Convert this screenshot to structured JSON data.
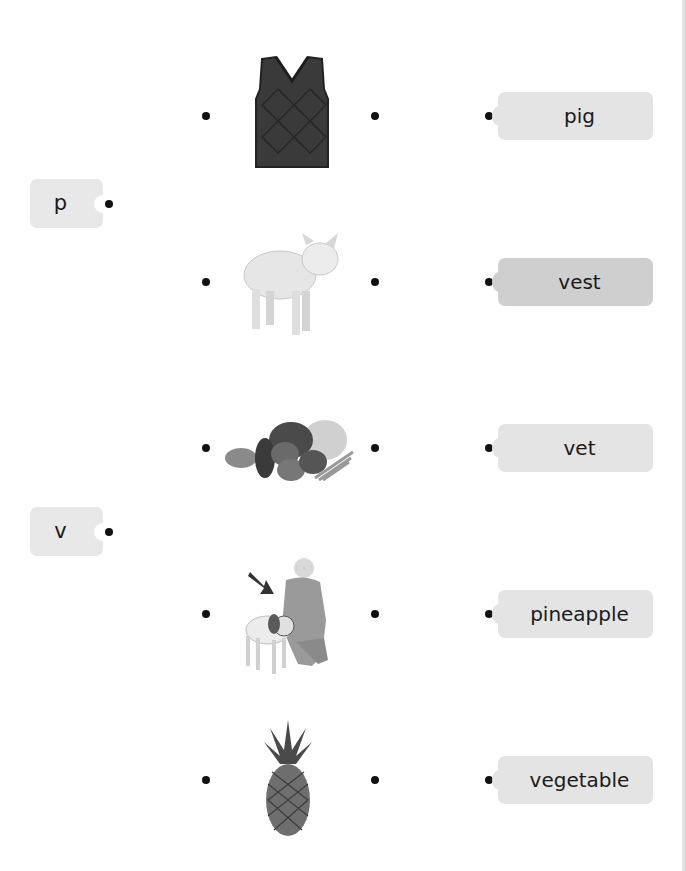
{
  "worksheet": {
    "letters": [
      {
        "label": "p",
        "top": 179
      },
      {
        "label": "v",
        "top": 507
      }
    ],
    "pictures": [
      {
        "name": "vest",
        "icon": "vest-image",
        "center_y": 116
      },
      {
        "name": "pig",
        "icon": "pig-image",
        "center_y": 282
      },
      {
        "name": "vegetables",
        "icon": "vegetables-image",
        "center_y": 448
      },
      {
        "name": "vet",
        "icon": "vet-with-dog-image",
        "center_y": 614
      },
      {
        "name": "pineapple",
        "icon": "pineapple-image",
        "center_y": 780
      }
    ],
    "words": [
      {
        "label": "pig",
        "center_y": 116
      },
      {
        "label": "vest",
        "center_y": 282
      },
      {
        "label": "vet",
        "center_y": 448
      },
      {
        "label": "pineapple",
        "center_y": 614
      },
      {
        "label": "vegetable",
        "center_y": 780
      }
    ]
  },
  "colors": {
    "box_light": "#e4e4e4",
    "box_dark": "#cfcfcf",
    "dot": "#111111"
  }
}
